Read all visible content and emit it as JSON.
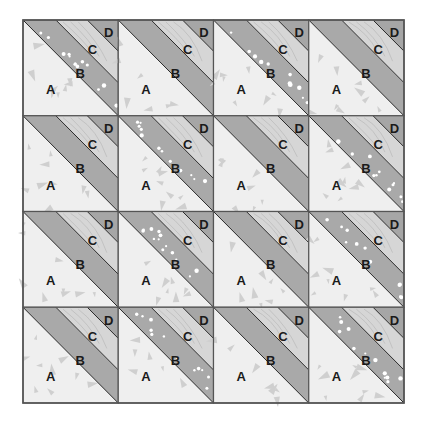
{
  "diagram": {
    "type": "quilt-block-layout",
    "grid": {
      "rows": 4,
      "cols": 4,
      "left": 23,
      "top": 20,
      "right": 404,
      "bottom": 403
    },
    "patch_labels": [
      "A",
      "B",
      "C",
      "D"
    ],
    "colors": {
      "background": "#ffffff",
      "A": "#efefef",
      "A_motif": "#cfcfcf",
      "B": "#a9a9a9",
      "C": "#d6d6d6",
      "C_contour": "#b4b4b4",
      "D": "#a6a6a6",
      "dot": "#ffffff",
      "seam": "#2a2a2a",
      "border": "#555555"
    },
    "geometry": {
      "ab_seam": [
        0.0,
        0.0,
        1.0,
        1.0
      ],
      "bc_seam": [
        0.345,
        0.0,
        1.0,
        0.655
      ],
      "cd_seam": [
        0.675,
        0.0,
        1.0,
        0.325
      ]
    },
    "label_positions": {
      "A": [
        0.29,
        0.72
      ],
      "B": [
        0.6,
        0.55
      ],
      "C": [
        0.73,
        0.3
      ],
      "D": [
        0.9,
        0.13
      ]
    },
    "blocks": [
      [
        {
          "row": 0,
          "col": 0,
          "dotted_b": true
        },
        {
          "row": 0,
          "col": 1,
          "dotted_b": false
        },
        {
          "row": 0,
          "col": 2,
          "dotted_b": true
        },
        {
          "row": 0,
          "col": 3,
          "dotted_b": false
        }
      ],
      [
        {
          "row": 1,
          "col": 0,
          "dotted_b": false
        },
        {
          "row": 1,
          "col": 1,
          "dotted_b": true
        },
        {
          "row": 1,
          "col": 2,
          "dotted_b": false
        },
        {
          "row": 1,
          "col": 3,
          "dotted_b": true
        }
      ],
      [
        {
          "row": 2,
          "col": 0,
          "dotted_b": false
        },
        {
          "row": 2,
          "col": 1,
          "dotted_b": true
        },
        {
          "row": 2,
          "col": 2,
          "dotted_b": false
        },
        {
          "row": 2,
          "col": 3,
          "dotted_b": true
        }
      ],
      [
        {
          "row": 3,
          "col": 0,
          "dotted_b": false
        },
        {
          "row": 3,
          "col": 1,
          "dotted_b": true
        },
        {
          "row": 3,
          "col": 2,
          "dotted_b": false
        },
        {
          "row": 3,
          "col": 3,
          "dotted_b": true
        }
      ]
    ]
  }
}
